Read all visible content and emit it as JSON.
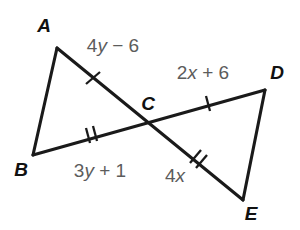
{
  "figure": {
    "background_color": "#ffffff",
    "line_color": "#1a1a1a",
    "vertex_label_color": "#111111",
    "expression_label_color": "#5c5c5c"
  },
  "vertices": [
    {
      "name": "A",
      "label": "A",
      "x": 57,
      "y": 48,
      "label_x": 44,
      "label_y": 32
    },
    {
      "name": "B",
      "label": "B",
      "x": 33,
      "y": 155,
      "label_x": 21,
      "label_y": 176
    },
    {
      "name": "C",
      "label": "C",
      "x": 148,
      "y": 121,
      "label_x": 148,
      "label_y": 110
    },
    {
      "name": "D",
      "label": "D",
      "x": 265,
      "y": 90,
      "label_x": 277,
      "label_y": 79
    },
    {
      "name": "E",
      "label": "E",
      "x": 243,
      "y": 200,
      "label_x": 251,
      "label_y": 220
    }
  ],
  "segments": [
    {
      "name": "AB",
      "from": "A",
      "to": "B"
    },
    {
      "name": "AE",
      "from": "A",
      "to": "E",
      "through": "C"
    },
    {
      "name": "BD",
      "from": "B",
      "to": "D",
      "through": "C"
    },
    {
      "name": "DE",
      "from": "D",
      "to": "E"
    }
  ],
  "tick_marks": [
    {
      "name": "tick-AC",
      "segment": "AC",
      "count": 1,
      "x": 93,
      "y": 78
    },
    {
      "name": "tick-CD",
      "segment": "CD",
      "count": 1,
      "x": 208,
      "y": 103
    },
    {
      "name": "tick-BC",
      "segment": "BC",
      "count": 2,
      "x": 91,
      "y": 134
    },
    {
      "name": "tick-CE",
      "segment": "CE",
      "count": 2,
      "x": 196,
      "y": 158
    }
  ],
  "measure_labels": [
    {
      "name": "label-AC",
      "segment": "AC",
      "text": "4y − 6",
      "coefficient": 4,
      "variable": "y",
      "operator": "−",
      "constant": 6,
      "x": 113,
      "y": 52
    },
    {
      "name": "label-CD",
      "segment": "CD",
      "text": "2x + 6",
      "coefficient": 2,
      "variable": "x",
      "operator": "+",
      "constant": 6,
      "x": 203,
      "y": 79
    },
    {
      "name": "label-BC",
      "segment": "BC",
      "text": "3y + 1",
      "coefficient": 3,
      "variable": "y",
      "operator": "+",
      "constant": 1,
      "x": 100,
      "y": 177
    },
    {
      "name": "label-CE",
      "segment": "CE",
      "text": "4x",
      "coefficient": 4,
      "variable": "x",
      "operator": "",
      "constant": null,
      "x": 175,
      "y": 182
    }
  ],
  "label_parts": {
    "ac": {
      "pre": "4",
      "var": "y",
      "post": " − 6"
    },
    "cd": {
      "pre": "2",
      "var": "x",
      "post": " + 6"
    },
    "bc": {
      "pre": "3",
      "var": "y",
      "post": " + 1"
    },
    "ce": {
      "pre": "4",
      "var": "x",
      "post": ""
    }
  }
}
